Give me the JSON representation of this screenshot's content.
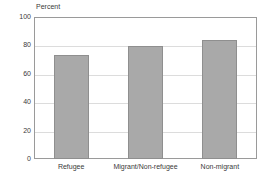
{
  "chart_data": {
    "type": "bar",
    "title": "",
    "subtitle": "",
    "xlabel": "",
    "ylabel": "Percent",
    "categories": [
      "Refugee",
      "Migrant/Non-refugee",
      "Non-migrant"
    ],
    "values": [
      73.5,
      79.5,
      84
    ],
    "ylim": [
      0,
      100
    ],
    "yticks": [
      0,
      20,
      40,
      60,
      80,
      100
    ],
    "ytick_labels": [
      "0",
      "20",
      "40",
      "60",
      "80",
      "100"
    ],
    "grid": true,
    "legend": false,
    "legend_position": "none",
    "bar_color": "#a9a9a9",
    "bar_border_color": "#8f8f8f",
    "grid_color": "#dcdcdc",
    "frame_color": "#9a9a9a",
    "background": "#ffffff",
    "text_color": "#3a3a3a"
  }
}
